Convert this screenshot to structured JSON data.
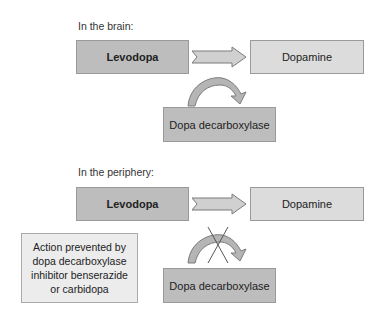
{
  "brain": {
    "heading": "In the brain:",
    "source": "Levodopa",
    "product": "Dopamine",
    "enzyme": "Dopa decarboxylase"
  },
  "periphery": {
    "heading": "In the periphery:",
    "source": "Levodopa",
    "product": "Dopamine",
    "enzyme": "Dopa decarboxylase",
    "note": "Action prevented by dopa decarboxylase inhibitor benserazide or carbidopa"
  },
  "colors": {
    "box_dark": "#bdbdbd",
    "box_light": "#dcdcdc",
    "note_bg": "#ececec",
    "arrow_fill": "#d0d0d0"
  }
}
